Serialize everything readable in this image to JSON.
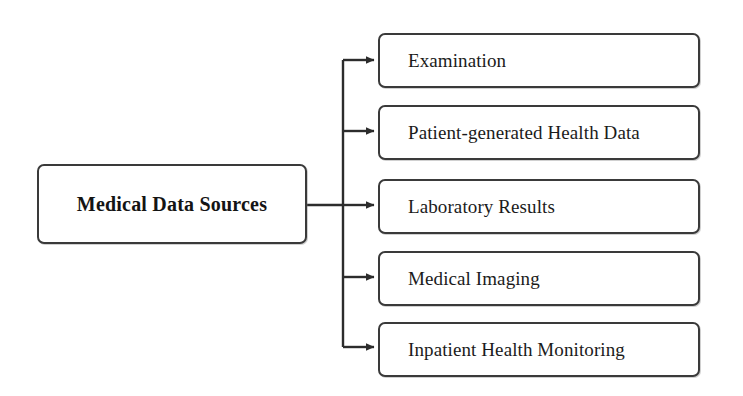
{
  "diagram": {
    "title": "Medical Data Sources",
    "type": "tree-hierarchy",
    "orientation": "left-to-right",
    "canvas": {
      "width": 743,
      "height": 396,
      "background": "#ffffff"
    },
    "stroke_color": "#3a3a3a",
    "text_color": "#1b1b1b"
  },
  "root": {
    "label": "Medical Data Sources"
  },
  "branches": [
    {
      "label": "Examination"
    },
    {
      "label": "Patient-generated Health Data"
    },
    {
      "label": "Laboratory Results"
    },
    {
      "label": "Medical Imaging"
    },
    {
      "label": "Inpatient Health Monitoring"
    }
  ]
}
